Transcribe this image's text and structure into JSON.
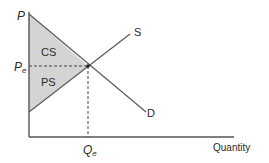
{
  "diagram": {
    "axes": {
      "y_label": "P",
      "x_label": "Quantity"
    },
    "curves": {
      "supply_label": "S",
      "demand_label": "D"
    },
    "equilibrium": {
      "price_label": "P",
      "price_sub": "e",
      "quantity_label": "Q",
      "quantity_sub": "e"
    },
    "regions": {
      "consumer_surplus": "CS",
      "producer_surplus": "PS"
    },
    "colors": {
      "axis": "#555555",
      "line": "#555555",
      "fill": "#d4d4d4",
      "text": "#2a2a2a"
    }
  }
}
